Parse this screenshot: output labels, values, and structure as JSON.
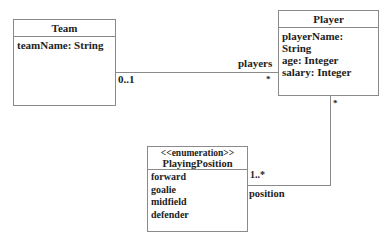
{
  "diagram": {
    "type": "uml-class",
    "classes": [
      {
        "name": "Team",
        "attributes": [
          "teamName: String"
        ]
      },
      {
        "name": "Player",
        "attributes": [
          "playerName: String",
          "age: Integer",
          "salary: Integer"
        ]
      },
      {
        "name": "PlayingPosition",
        "stereotype": "<<enumeration>>",
        "literals": [
          "forward",
          "goalie",
          "midfield",
          "defender"
        ]
      }
    ],
    "associations": [
      {
        "from": "Team",
        "to": "Player",
        "from_multiplicity": "0..1",
        "to_multiplicity": "*",
        "to_role": "players"
      },
      {
        "from": "Player",
        "to": "PlayingPosition",
        "from_multiplicity": "*",
        "to_multiplicity": "1..*",
        "to_role": "position"
      }
    ],
    "colors": {
      "line": "#8a8a8a",
      "text": "#222222",
      "background": "#ffffff"
    }
  }
}
